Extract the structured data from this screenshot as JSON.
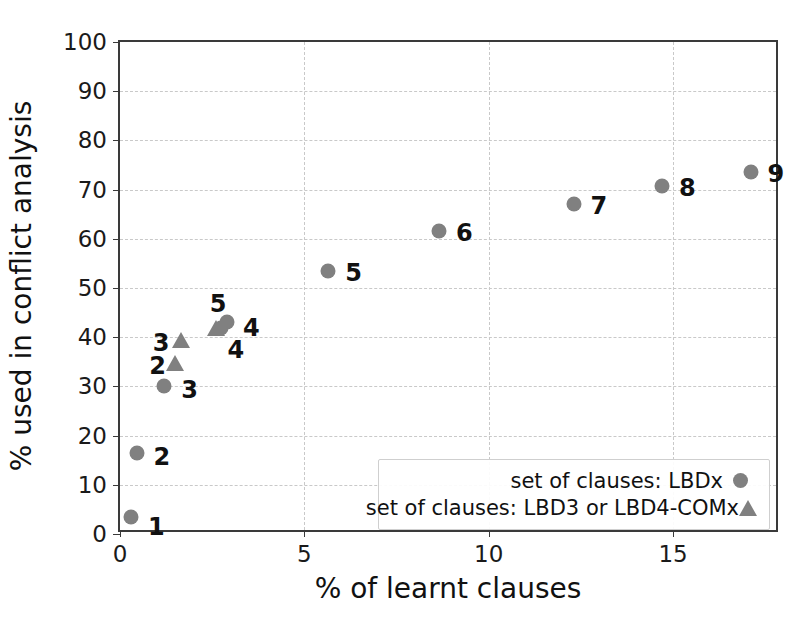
{
  "chart_data": {
    "type": "scatter",
    "title": "",
    "xlabel": "% of learnt clauses",
    "ylabel": "% used in conflict analysis",
    "xlim": [
      0,
      17.9
    ],
    "ylim": [
      0,
      100
    ],
    "xticks": [
      0,
      5,
      10,
      15
    ],
    "xtick_labels": [
      "0",
      "5",
      "10",
      "15"
    ],
    "yticks": [
      0,
      10,
      20,
      30,
      40,
      50,
      60,
      70,
      80,
      90,
      100
    ],
    "ytick_labels": [
      "0",
      "10",
      "20",
      "30",
      "40",
      "50",
      "60",
      "70",
      "80",
      "90",
      "100"
    ],
    "grid": true,
    "grid_style": "dashed",
    "grid_color": "#c9c9c9",
    "marker_color": "#808080",
    "legend_position": "lower right",
    "series": [
      {
        "name": "set of clauses: LBDx",
        "marker": "circle",
        "points": [
          {
            "label": "1",
            "x": 0.3,
            "y": 3.5,
            "label_dx": 17,
            "label_dy": 10
          },
          {
            "label": "2",
            "x": 0.45,
            "y": 16.5,
            "label_dx": 17,
            "label_dy": 4
          },
          {
            "label": "3",
            "x": 1.2,
            "y": 30.0,
            "label_dx": 17,
            "label_dy": 4
          },
          {
            "label": "4",
            "x": 2.9,
            "y": 43.0,
            "label_dx": 16,
            "label_dy": 6
          },
          {
            "label": "4",
            "x": 2.75,
            "y": 41.8,
            "label_dx": 6,
            "label_dy": 22
          },
          {
            "label": "5",
            "x": 5.65,
            "y": 53.5,
            "label_dx": 17,
            "label_dy": 2
          },
          {
            "label": "6",
            "x": 8.65,
            "y": 61.5,
            "label_dx": 17,
            "label_dy": 2
          },
          {
            "label": "7",
            "x": 12.3,
            "y": 67.0,
            "label_dx": 17,
            "label_dy": 2
          },
          {
            "label": "8",
            "x": 14.7,
            "y": 70.8,
            "label_dx": 17,
            "label_dy": 2
          },
          {
            "label": "9",
            "x": 17.1,
            "y": 73.6,
            "label_dx": 17,
            "label_dy": 2
          }
        ]
      },
      {
        "name": "set of clauses: LBD3 or LBD4-COMx",
        "marker": "triangle",
        "points": [
          {
            "label": "2",
            "x": 1.5,
            "y": 34.8,
            "label_dx": -26,
            "label_dy": 3
          },
          {
            "label": "3",
            "x": 1.65,
            "y": 39.4,
            "label_dx": -28,
            "label_dy": 3
          },
          {
            "label": "5",
            "x": 2.6,
            "y": 41.8,
            "label_dx": -6,
            "label_dy": -24
          }
        ]
      }
    ]
  },
  "legend": {
    "entries": [
      {
        "label": "set of clauses: LBDx",
        "marker": "circle"
      },
      {
        "label": "set of clauses: LBD3 or LBD4-COMx",
        "marker": "triangle"
      }
    ]
  }
}
